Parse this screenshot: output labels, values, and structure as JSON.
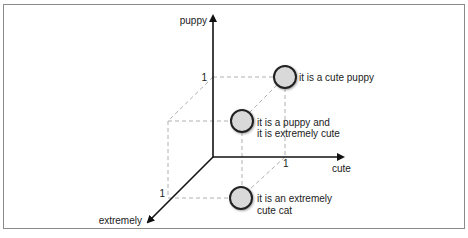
{
  "diagram": {
    "type": "3d-vector-space",
    "axes": {
      "y": {
        "label": "puppy",
        "tick": "1"
      },
      "x": {
        "label": "cute",
        "tick": "1"
      },
      "z": {
        "label": "extremely",
        "tick": "1"
      }
    },
    "points": [
      {
        "id": "cute-puppy",
        "label_lines": [
          "it is a cute puppy"
        ]
      },
      {
        "id": "puppy-extremely-cute",
        "label_lines": [
          "it is a puppy and",
          "it is extremely cute"
        ]
      },
      {
        "id": "extremely-cute-cat",
        "label_lines": [
          "it is an extremely",
          "cute cat"
        ]
      }
    ],
    "colors": {
      "axis": "#111111",
      "dashed": "#b0b0b0",
      "point_fill": "#d9d9d9",
      "point_stroke": "#222222",
      "frame": "#8a8a8a"
    }
  }
}
